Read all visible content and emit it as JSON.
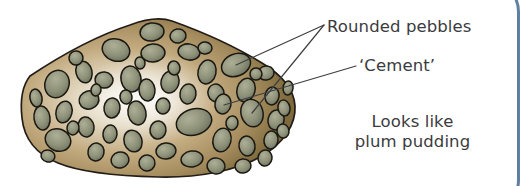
{
  "figure": {
    "labels": {
      "pebbles": "Rounded pebbles",
      "cement": "‘Cement’",
      "pudding_line1": "Looks like",
      "pudding_line2": "plum pudding"
    }
  },
  "colors": {
    "frame_border": "#5d7e9e",
    "rock_matrix_light": "#efeae0",
    "rock_matrix_mid": "#b49a6e",
    "rock_matrix_dark": "#7d6b3f",
    "pebble_fill": "#8d9179",
    "pebble_fill_light": "#a8ab92",
    "outline": "#1d1a16",
    "leader_line": "#3f3f42",
    "text": "#3b3b3d",
    "page_background": "#ffffff"
  },
  "geometry": {
    "width": 532,
    "height": 186,
    "rock_pebble_count": 58,
    "leader_lines": 3
  }
}
